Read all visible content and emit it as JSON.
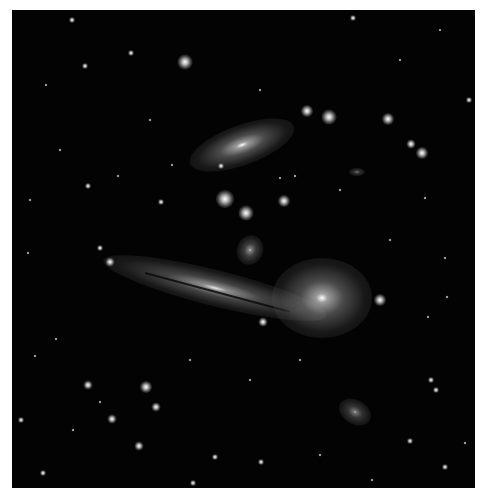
{
  "image": {
    "subject": "galaxy group field",
    "background": "#030303",
    "border": "#ffffff"
  },
  "galaxies": [
    {
      "name": "spiral-galaxy-upper",
      "cx": 242,
      "cy": 145,
      "w": 110,
      "h": 40,
      "rot": -20,
      "core": 1.0
    },
    {
      "name": "edge-on-galaxy",
      "cx": 215,
      "cy": 288,
      "w": 230,
      "h": 36,
      "rot": 14,
      "core": 0.9
    },
    {
      "name": "elliptical-galaxy-bright",
      "cx": 322,
      "cy": 298,
      "w": 100,
      "h": 80,
      "rot": 0,
      "core": 1.0
    },
    {
      "name": "small-spiral-galaxy",
      "cx": 250,
      "cy": 250,
      "w": 26,
      "h": 30,
      "rot": 20,
      "core": 0.8
    },
    {
      "name": "elliptical-galaxy-lower",
      "cx": 355,
      "cy": 412,
      "w": 34,
      "h": 24,
      "rot": 30,
      "core": 0.7
    },
    {
      "name": "small-galaxy-right",
      "cx": 357,
      "cy": 172,
      "w": 16,
      "h": 8,
      "rot": 0,
      "core": 0.6
    }
  ],
  "stars": [
    {
      "x": 185,
      "y": 62,
      "r": 5
    },
    {
      "x": 225,
      "y": 199,
      "r": 6
    },
    {
      "x": 246,
      "y": 213,
      "r": 5
    },
    {
      "x": 284,
      "y": 201,
      "r": 4
    },
    {
      "x": 307,
      "y": 111,
      "r": 4
    },
    {
      "x": 329,
      "y": 117,
      "r": 5
    },
    {
      "x": 388,
      "y": 119,
      "r": 4
    },
    {
      "x": 411,
      "y": 144,
      "r": 3
    },
    {
      "x": 422,
      "y": 153,
      "r": 4
    },
    {
      "x": 380,
      "y": 300,
      "r": 4
    },
    {
      "x": 146,
      "y": 387,
      "r": 4
    },
    {
      "x": 88,
      "y": 385,
      "r": 3
    },
    {
      "x": 156,
      "y": 407,
      "r": 3
    },
    {
      "x": 112,
      "y": 419,
      "r": 3
    },
    {
      "x": 139,
      "y": 446,
      "r": 3
    },
    {
      "x": 110,
      "y": 262,
      "r": 3
    },
    {
      "x": 100,
      "y": 248,
      "r": 2
    },
    {
      "x": 263,
      "y": 322,
      "r": 3
    },
    {
      "x": 85,
      "y": 66,
      "r": 2
    },
    {
      "x": 88,
      "y": 186,
      "r": 2
    },
    {
      "x": 131,
      "y": 53,
      "r": 2
    },
    {
      "x": 161,
      "y": 202,
      "r": 2
    },
    {
      "x": 221,
      "y": 166,
      "r": 2
    },
    {
      "x": 431,
      "y": 380,
      "r": 2
    },
    {
      "x": 445,
      "y": 467,
      "r": 2
    },
    {
      "x": 193,
      "y": 483,
      "r": 2
    },
    {
      "x": 261,
      "y": 462,
      "r": 2
    },
    {
      "x": 215,
      "y": 457,
      "r": 2
    },
    {
      "x": 43,
      "y": 473,
      "r": 2
    },
    {
      "x": 21,
      "y": 420,
      "r": 2
    },
    {
      "x": 410,
      "y": 441,
      "r": 2
    },
    {
      "x": 436,
      "y": 390,
      "r": 2
    },
    {
      "x": 469,
      "y": 100,
      "r": 2
    },
    {
      "x": 353,
      "y": 18,
      "r": 2
    },
    {
      "x": 72,
      "y": 20,
      "r": 2
    },
    {
      "x": 46,
      "y": 85,
      "r": 1
    },
    {
      "x": 172,
      "y": 165,
      "r": 1
    },
    {
      "x": 118,
      "y": 176,
      "r": 1
    },
    {
      "x": 280,
      "y": 178,
      "r": 1
    },
    {
      "x": 295,
      "y": 176,
      "r": 1
    },
    {
      "x": 340,
      "y": 190,
      "r": 1
    },
    {
      "x": 425,
      "y": 198,
      "r": 1
    },
    {
      "x": 390,
      "y": 240,
      "r": 1
    },
    {
      "x": 445,
      "y": 258,
      "r": 1
    },
    {
      "x": 447,
      "y": 297,
      "r": 1
    },
    {
      "x": 428,
      "y": 317,
      "r": 1
    },
    {
      "x": 56,
      "y": 339,
      "r": 1
    },
    {
      "x": 100,
      "y": 402,
      "r": 1
    },
    {
      "x": 73,
      "y": 430,
      "r": 1
    },
    {
      "x": 320,
      "y": 455,
      "r": 1
    },
    {
      "x": 372,
      "y": 480,
      "r": 1
    },
    {
      "x": 465,
      "y": 443,
      "r": 1
    },
    {
      "x": 35,
      "y": 356,
      "r": 1
    },
    {
      "x": 28,
      "y": 253,
      "r": 1
    },
    {
      "x": 190,
      "y": 360,
      "r": 1
    },
    {
      "x": 250,
      "y": 380,
      "r": 1
    },
    {
      "x": 300,
      "y": 360,
      "r": 1
    },
    {
      "x": 60,
      "y": 150,
      "r": 1
    },
    {
      "x": 150,
      "y": 120,
      "r": 1
    },
    {
      "x": 260,
      "y": 90,
      "r": 1
    },
    {
      "x": 400,
      "y": 60,
      "r": 1
    },
    {
      "x": 440,
      "y": 30,
      "r": 1
    },
    {
      "x": 30,
      "y": 200,
      "r": 1
    }
  ]
}
